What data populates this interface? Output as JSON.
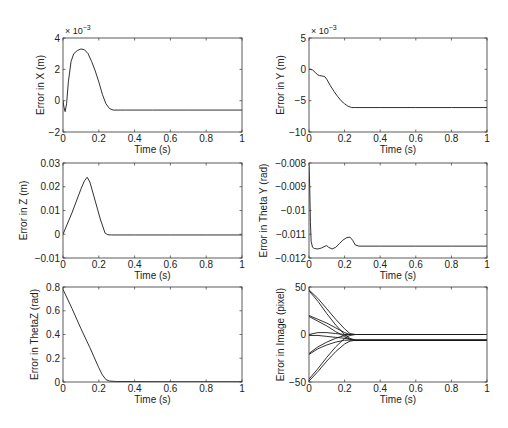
{
  "figure": {
    "width": 508,
    "height": 428,
    "background": "#ffffff",
    "line_color": "#1a1a1a"
  },
  "chart_data": [
    {
      "id": "x-error",
      "type": "line",
      "box": [
        63,
        38,
        242,
        132
      ],
      "title": "",
      "xlabel": "Time (s)",
      "ylabel": "Error in X (m)",
      "xlim": [
        0,
        1
      ],
      "ylim": [
        -0.002,
        0.004
      ],
      "xticks": [
        0,
        0.2,
        0.4,
        0.6,
        0.8,
        1
      ],
      "xtick_labels": [
        "0",
        "0.2",
        "0.4",
        "0.6",
        "0.8",
        "1"
      ],
      "yticks": [
        -0.002,
        0,
        0.002,
        0.004
      ],
      "ytick_labels": [
        "−2",
        "0",
        "2",
        "4"
      ],
      "exponent_label": "× 10",
      "exponent_power": "−3",
      "grid": false,
      "series": [
        {
          "name": "X error",
          "x": [
            0,
            0.005,
            0.012,
            0.02,
            0.03,
            0.045,
            0.06,
            0.08,
            0.1,
            0.12,
            0.14,
            0.16,
            0.18,
            0.2,
            0.22,
            0.24,
            0.26,
            0.28,
            0.35,
            0.5,
            0.7,
            1.0
          ],
          "y": [
            0.0,
            -0.0004,
            -0.0007,
            -0.0002,
            0.0012,
            0.0025,
            0.003,
            0.0032,
            0.0033,
            0.00325,
            0.003,
            0.0025,
            0.0019,
            0.0012,
            0.0004,
            -0.0002,
            -0.0005,
            -0.0006,
            -0.0006,
            -0.0006,
            -0.0006,
            -0.0006
          ]
        }
      ]
    },
    {
      "id": "y-error",
      "type": "line",
      "box": [
        309,
        38,
        487,
        132
      ],
      "title": "",
      "xlabel": "Time (s)",
      "ylabel": "Error in Y (m)",
      "xlim": [
        0,
        1
      ],
      "ylim": [
        -0.01,
        0.005
      ],
      "xticks": [
        0,
        0.2,
        0.4,
        0.6,
        0.8,
        1
      ],
      "xtick_labels": [
        "0",
        "0.2",
        "0.4",
        "0.6",
        "0.8",
        "1"
      ],
      "yticks": [
        -0.01,
        -0.005,
        0,
        0.005
      ],
      "ytick_labels": [
        "−10",
        "−5",
        "0",
        "5"
      ],
      "exponent_label": "× 10",
      "exponent_power": "−3",
      "grid": false,
      "series": [
        {
          "name": "Y error",
          "x": [
            0,
            0.01,
            0.02,
            0.035,
            0.05,
            0.06,
            0.08,
            0.09,
            0.1,
            0.12,
            0.14,
            0.16,
            0.18,
            0.2,
            0.22,
            0.24,
            0.26,
            0.4,
            0.6,
            0.8,
            1.0
          ],
          "y": [
            0.0,
            0.0,
            -0.0001,
            -0.0005,
            -0.0009,
            -0.001,
            -0.0011,
            -0.0012,
            -0.0016,
            -0.0026,
            -0.0035,
            -0.0043,
            -0.005,
            -0.0055,
            -0.0059,
            -0.0061,
            -0.0061,
            -0.0061,
            -0.0061,
            -0.0061,
            -0.0061
          ]
        }
      ]
    },
    {
      "id": "z-error",
      "type": "line",
      "box": [
        63,
        163,
        242,
        258
      ],
      "title": "",
      "xlabel": "Time (s)",
      "ylabel": "Error in Z (m)",
      "xlim": [
        0,
        1
      ],
      "ylim": [
        -0.01,
        0.03
      ],
      "xticks": [
        0,
        0.2,
        0.4,
        0.6,
        0.8,
        1
      ],
      "xtick_labels": [
        "0",
        "0.2",
        "0.4",
        "0.6",
        "0.8",
        "1"
      ],
      "yticks": [
        -0.01,
        0,
        0.01,
        0.02,
        0.03
      ],
      "ytick_labels": [
        "−0.01",
        "0",
        "0.01",
        "0.02",
        "0.03"
      ],
      "grid": false,
      "series": [
        {
          "name": "Z error",
          "x": [
            0,
            0.05,
            0.1,
            0.12,
            0.135,
            0.15,
            0.18,
            0.21,
            0.235,
            0.25,
            0.27,
            0.4,
            0.6,
            0.8,
            1.0
          ],
          "y": [
            0.0,
            0.009,
            0.019,
            0.0225,
            0.024,
            0.022,
            0.014,
            0.006,
            0.0005,
            -0.0002,
            -0.0003,
            -0.0003,
            -0.0003,
            -0.0003,
            -0.0003
          ]
        }
      ]
    },
    {
      "id": "thetay-error",
      "type": "line",
      "box": [
        309,
        163,
        487,
        258
      ],
      "title": "",
      "xlabel": "Time (s)",
      "ylabel": "Error in Theta Y (rad)",
      "xlim": [
        0,
        1
      ],
      "ylim": [
        -0.012,
        -0.008
      ],
      "xticks": [
        0,
        0.2,
        0.4,
        0.6,
        0.8,
        1
      ],
      "xtick_labels": [
        "0",
        "0.2",
        "0.4",
        "0.6",
        "0.8",
        "1"
      ],
      "yticks": [
        -0.012,
        -0.011,
        -0.01,
        -0.009,
        -0.008
      ],
      "ytick_labels": [
        "−0.012",
        "−0.011",
        "−0.01",
        "−0.009",
        "−0.008"
      ],
      "grid": false,
      "series": [
        {
          "name": "Theta Y error",
          "x": [
            0,
            0.004,
            0.008,
            0.012,
            0.02,
            0.03,
            0.05,
            0.07,
            0.09,
            0.1,
            0.11,
            0.13,
            0.15,
            0.17,
            0.19,
            0.21,
            0.23,
            0.245,
            0.26,
            0.28,
            0.4,
            0.6,
            0.8,
            1.0
          ],
          "y": [
            -0.0081,
            -0.009,
            -0.0105,
            -0.0113,
            -0.01155,
            -0.0116,
            -0.01162,
            -0.01158,
            -0.0115,
            -0.01148,
            -0.01155,
            -0.01162,
            -0.01155,
            -0.0114,
            -0.01125,
            -0.01115,
            -0.01112,
            -0.01125,
            -0.01145,
            -0.0115,
            -0.0115,
            -0.0115,
            -0.0115,
            -0.0115
          ]
        }
      ]
    },
    {
      "id": "thetaz-error",
      "type": "line",
      "box": [
        63,
        287,
        242,
        382
      ],
      "title": "",
      "xlabel": "Time (s)",
      "ylabel": "Error in ThetaZ (rad)",
      "xlim": [
        0,
        1
      ],
      "ylim": [
        0,
        0.8
      ],
      "xticks": [
        0,
        0.2,
        0.4,
        0.6,
        0.8,
        1
      ],
      "xtick_labels": [
        "0",
        "0.2",
        "0.4",
        "0.6",
        "0.8",
        "1"
      ],
      "yticks": [
        0,
        0.2,
        0.4,
        0.6,
        0.8
      ],
      "ytick_labels": [
        "0",
        "0.2",
        "0.4",
        "0.6",
        "0.8"
      ],
      "grid": false,
      "series": [
        {
          "name": "Theta Z error",
          "x": [
            0,
            0.05,
            0.1,
            0.15,
            0.2,
            0.22,
            0.24,
            0.26,
            0.3,
            0.4,
            0.6,
            0.8,
            1.0
          ],
          "y": [
            0.78,
            0.62,
            0.45,
            0.29,
            0.12,
            0.06,
            0.02,
            0.008,
            0.004,
            0.003,
            0.002,
            0.002,
            0.002
          ]
        }
      ]
    },
    {
      "id": "image-error",
      "type": "line",
      "box": [
        309,
        287,
        487,
        382
      ],
      "title": "",
      "xlabel": "Time (s)",
      "ylabel": "Error in Image (pixel)",
      "xlim": [
        0,
        1
      ],
      "ylim": [
        -50,
        50
      ],
      "xticks": [
        0,
        0.2,
        0.4,
        0.6,
        0.8,
        1
      ],
      "xtick_labels": [
        "0",
        "0.2",
        "0.4",
        "0.6",
        "0.8",
        "1"
      ],
      "yticks": [
        -50,
        0,
        50
      ],
      "ytick_labels": [
        "−50",
        "0",
        "50"
      ],
      "grid": false,
      "series": [
        {
          "name": "f1",
          "x": [
            0,
            0.05,
            0.1,
            0.15,
            0.2,
            0.23,
            0.26,
            1.0
          ],
          "y": [
            47,
            38,
            27,
            16,
            6,
            1,
            0,
            0
          ]
        },
        {
          "name": "f2",
          "x": [
            0,
            0.05,
            0.1,
            0.15,
            0.2,
            0.23,
            0.26,
            1.0
          ],
          "y": [
            46,
            35,
            22,
            10,
            0,
            -4,
            -6,
            -6
          ]
        },
        {
          "name": "f3",
          "x": [
            0,
            0.05,
            0.1,
            0.15,
            0.2,
            0.23,
            0.26,
            1.0
          ],
          "y": [
            20,
            16,
            12,
            7,
            2,
            0,
            0,
            0
          ]
        },
        {
          "name": "f4",
          "x": [
            0,
            0.05,
            0.1,
            0.15,
            0.2,
            0.23,
            0.26,
            1.0
          ],
          "y": [
            19,
            14,
            9,
            3,
            -2,
            -5,
            -6,
            -6
          ]
        },
        {
          "name": "f5",
          "x": [
            0,
            0.05,
            0.1,
            0.15,
            0.2,
            0.23,
            0.26,
            1.0
          ],
          "y": [
            0,
            2,
            2,
            1,
            0,
            0,
            0,
            0
          ]
        },
        {
          "name": "f6",
          "x": [
            0,
            0.05,
            0.1,
            0.15,
            0.2,
            0.23,
            0.26,
            1.0
          ],
          "y": [
            -1,
            -1,
            -2,
            -3,
            -4,
            -5,
            -6,
            -6
          ]
        },
        {
          "name": "f7",
          "x": [
            0,
            0.05,
            0.1,
            0.15,
            0.2,
            0.23,
            0.26,
            1.0
          ],
          "y": [
            -20,
            -13,
            -8,
            -4,
            -1,
            0,
            0,
            0
          ]
        },
        {
          "name": "f8",
          "x": [
            0,
            0.05,
            0.1,
            0.15,
            0.2,
            0.23,
            0.26,
            1.0
          ],
          "y": [
            -21,
            -15,
            -11,
            -8,
            -6,
            -6,
            -6,
            -6
          ]
        },
        {
          "name": "f9",
          "x": [
            0,
            0.05,
            0.1,
            0.15,
            0.2,
            0.23,
            0.26,
            1.0
          ],
          "y": [
            -47,
            -36,
            -24,
            -13,
            -4,
            -1,
            0,
            0
          ]
        },
        {
          "name": "f10",
          "x": [
            0,
            0.05,
            0.1,
            0.15,
            0.2,
            0.23,
            0.26,
            1.0
          ],
          "y": [
            -49,
            -39,
            -28,
            -18,
            -10,
            -7,
            -6,
            -6
          ]
        }
      ]
    }
  ]
}
